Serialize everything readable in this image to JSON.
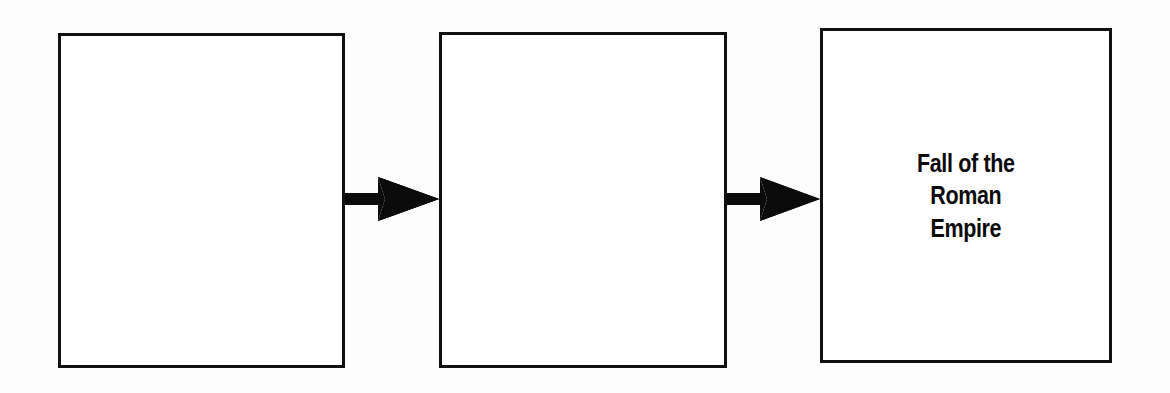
{
  "diagram": {
    "type": "cause-and-effect-chain",
    "orientation": "horizontal",
    "background_color": "#fdfdfd",
    "stroke_color": "#111111",
    "text_color": "#0b0b0b",
    "boxes": [
      {
        "id": "box-1",
        "position": 1,
        "text": "",
        "filled": false,
        "x": 58,
        "y": 33,
        "width": 287,
        "height": 335
      },
      {
        "id": "box-2",
        "position": 2,
        "text": "",
        "filled": false,
        "x": 439,
        "y": 32,
        "width": 288,
        "height": 336
      },
      {
        "id": "box-3",
        "position": 3,
        "text": "Fall of the\nRoman\nEmpire",
        "filled": true,
        "x": 820,
        "y": 28,
        "width": 292,
        "height": 335
      }
    ],
    "arrows": [
      {
        "id": "arrow-1",
        "from": "box-1",
        "to": "box-2",
        "direction": "right",
        "x": 345,
        "y": 176,
        "width": 94,
        "height": 46
      },
      {
        "id": "arrow-2",
        "from": "box-2",
        "to": "box-3",
        "direction": "right",
        "x": 727,
        "y": 176,
        "width": 93,
        "height": 46
      }
    ]
  }
}
